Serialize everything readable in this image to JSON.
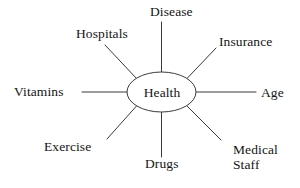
{
  "diagram": {
    "type": "spider-map",
    "center": {
      "label": "Health",
      "shape": "ellipse",
      "cx": 161.5,
      "cy": 92,
      "rx": 34.5,
      "ry": 20
    },
    "style": {
      "background": "#ffffff",
      "line_color": "#3a3a3a",
      "text_color": "#141414",
      "line_width": 1
    },
    "nodes": [
      {
        "id": "disease",
        "label": "Disease",
        "direction": "top",
        "line": {
          "x1": 161.5,
          "y1": 72,
          "x2": 161.5,
          "y2": 22
        }
      },
      {
        "id": "hospitals",
        "label": "Hospitals",
        "direction": "top-left",
        "line": {
          "x1": 136.5,
          "y1": 78.5,
          "x2": 105,
          "y2": 45
        }
      },
      {
        "id": "insurance",
        "label": "Insurance",
        "direction": "top-right",
        "line": {
          "x1": 187,
          "y1": 78.5,
          "x2": 216,
          "y2": 48
        }
      },
      {
        "id": "vitamins",
        "label": "Vitamins",
        "direction": "left",
        "line": {
          "x1": 127,
          "y1": 92,
          "x2": 82,
          "y2": 92
        }
      },
      {
        "id": "age",
        "label": "Age",
        "direction": "right",
        "line": {
          "x1": 196,
          "y1": 92,
          "x2": 256,
          "y2": 92
        }
      },
      {
        "id": "exercise",
        "label": "Exercise",
        "direction": "bottom-left",
        "line": {
          "x1": 136.5,
          "y1": 106,
          "x2": 107,
          "y2": 139
        }
      },
      {
        "id": "drugs",
        "label": "Drugs",
        "direction": "bottom",
        "line": {
          "x1": 161.5,
          "y1": 112,
          "x2": 161.5,
          "y2": 157
        }
      },
      {
        "id": "medical-staff",
        "label": "Medical\nStaff",
        "direction": "bottom-right",
        "line": {
          "x1": 187,
          "y1": 106,
          "x2": 221,
          "y2": 140
        }
      }
    ]
  }
}
